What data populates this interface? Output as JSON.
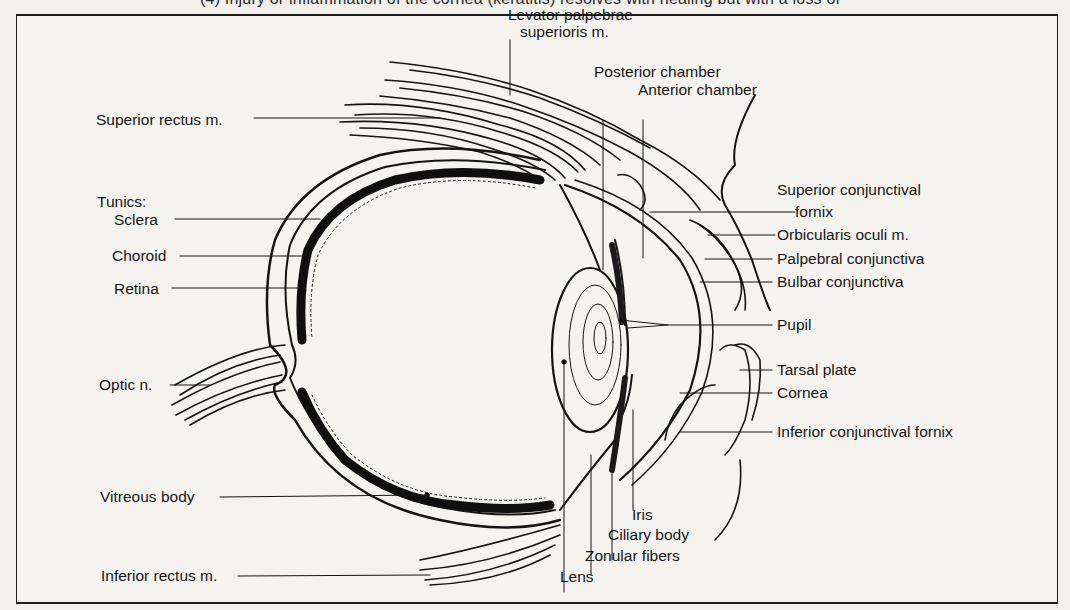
{
  "page": {
    "top_caption": "(4) Injury or inflammation of the cornea (keratitis) resolves with healing but with a loss of"
  },
  "diagram": {
    "labels": {
      "levator_line1": "Levator palpebrae",
      "levator_line2": "superioris m.",
      "posterior_chamber": "Posterior chamber",
      "anterior_chamber": "Anterior chamber",
      "superior_rectus": "Superior rectus m.",
      "tunics": "Tunics:",
      "sclera": "Sclera",
      "choroid": "Choroid",
      "retina": "Retina",
      "optic_nerve": "Optic n.",
      "vitreous_body": "Vitreous body",
      "inferior_rectus": "Inferior rectus m.",
      "superior_conj_fornix_line1": "Superior conjunctival",
      "superior_conj_fornix_line2": "fornix",
      "orbicularis_oculi": "Orbicularis oculi m.",
      "palpebral_conjunctiva": "Palpebral conjunctiva",
      "bulbar_conjunctiva": "Bulbar conjunctiva",
      "pupil": "Pupil",
      "tarsal_plate": "Tarsal plate",
      "cornea": "Cornea",
      "inferior_conj_fornix": "Inferior conjunctival fornix",
      "iris": "Iris",
      "ciliary_body": "Ciliary body",
      "zonular_fibers": "Zonular fibers",
      "lens": "Lens"
    }
  }
}
